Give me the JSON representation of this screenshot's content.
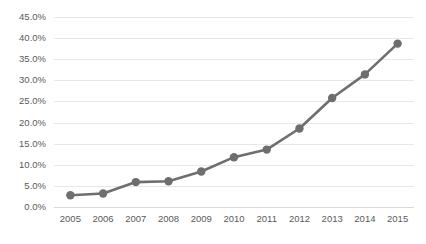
{
  "chart_data": {
    "type": "line",
    "title": "",
    "subtitle": "",
    "xlabel": "",
    "ylabel": "",
    "categories": [
      "2005",
      "2006",
      "2007",
      "2008",
      "2009",
      "2010",
      "2011",
      "2012",
      "2013",
      "2014",
      "2015"
    ],
    "x": [
      2005,
      2006,
      2007,
      2008,
      2009,
      2010,
      2011,
      2012,
      2013,
      2014,
      2015
    ],
    "values": [
      2.8,
      3.2,
      5.9,
      6.1,
      8.4,
      11.8,
      13.6,
      18.6,
      25.8,
      31.4,
      38.7
    ],
    "value_labels": [
      "2.8%",
      "3.2%",
      "5.9%",
      "6.1%",
      "8.4%",
      "11.8%",
      "13.6%",
      "18.6%",
      "25.8%",
      "31.4%",
      "38.7%"
    ],
    "series": [
      {
        "name": "",
        "values": [
          2.8,
          3.2,
          5.9,
          6.1,
          8.4,
          11.8,
          13.6,
          18.6,
          25.8,
          31.4,
          38.7
        ],
        "color": "#6e6e6e",
        "marker": "circle"
      }
    ],
    "ylim": [
      0,
      45
    ],
    "ytick_values": [
      0,
      5,
      10,
      15,
      20,
      25,
      30,
      35,
      40,
      45
    ],
    "ytick_labels": [
      "0.0%",
      "5.0%",
      "10.0%",
      "15.0%",
      "20.0%",
      "25.0%",
      "30.0%",
      "35.0%",
      "40.0%",
      "45.0%"
    ],
    "xtick_labels": [
      "2005",
      "2006",
      "2007",
      "2008",
      "2009",
      "2010",
      "2011",
      "2012",
      "2013",
      "2014",
      "2015"
    ],
    "grid": true,
    "grid_axis": "y",
    "grid_color": "#e8e8e8",
    "legend": false,
    "legend_position": "none",
    "annotations": [],
    "background_color": "#ffffff",
    "axis_label_color": "#5a5a5a",
    "line_color": "#6e6e6e",
    "line_width": 2.6,
    "marker_size": 4.2
  }
}
